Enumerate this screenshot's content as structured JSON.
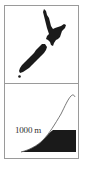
{
  "figure": {
    "map_panel": {
      "subject": "new-zealand-map-silhouette",
      "fill_color": "#1a1a1a"
    },
    "profile_panel": {
      "elevation_label": "1000 m",
      "curve_color": "#555555",
      "fill_color": "#1a1a1a"
    },
    "border_color": "#9a9a9a"
  }
}
